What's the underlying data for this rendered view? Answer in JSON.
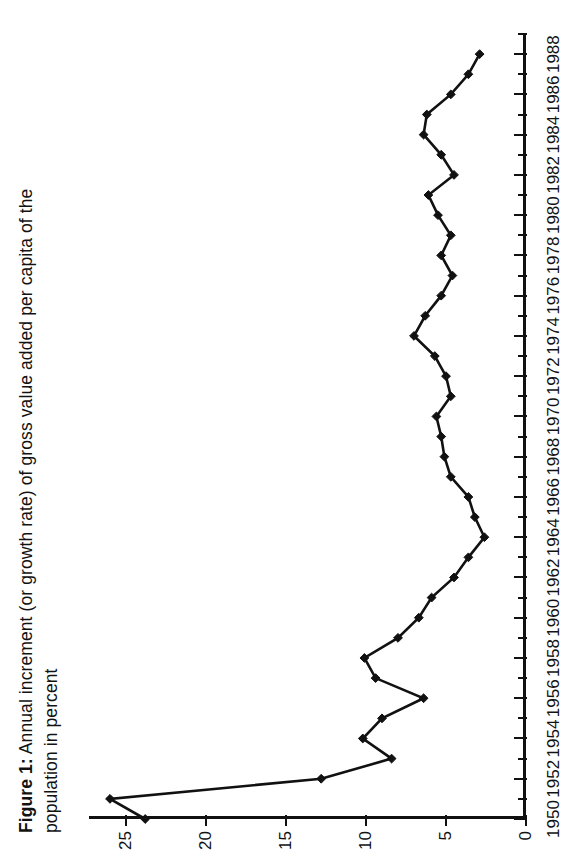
{
  "figure": {
    "label": "Figure 1:",
    "caption": "Annual increment (or growth rate) of gross value added per capita of the population in percent"
  },
  "chart_data": {
    "type": "line",
    "title": "Figure 1: Annual increment (or growth rate) of gross value added per capita of the population in percent",
    "xlabel": "",
    "ylabel": "",
    "xlim": [
      1950,
      1989
    ],
    "ylim": [
      0,
      27.5
    ],
    "grid": false,
    "legend": false,
    "x": [
      1950,
      1951,
      1952,
      1953,
      1954,
      1955,
      1956,
      1957,
      1958,
      1959,
      1960,
      1961,
      1962,
      1963,
      1964,
      1965,
      1966,
      1967,
      1968,
      1969,
      1970,
      1971,
      1972,
      1973,
      1974,
      1975,
      1976,
      1977,
      1978,
      1979,
      1980,
      1981,
      1982,
      1983,
      1984,
      1985,
      1986,
      1987,
      1988
    ],
    "values": [
      23.8,
      26.0,
      12.8,
      8.4,
      10.2,
      9.0,
      6.4,
      9.4,
      10.1,
      8.0,
      6.7,
      5.9,
      4.5,
      3.6,
      2.6,
      3.2,
      3.6,
      4.7,
      5.1,
      5.3,
      5.6,
      4.7,
      5.0,
      5.7,
      7.0,
      6.3,
      5.3,
      4.6,
      5.3,
      4.7,
      5.5,
      6.1,
      4.5,
      5.3,
      6.4,
      6.2,
      4.7,
      3.6,
      2.9
    ],
    "x_tick_labels": [
      "1950",
      "1952",
      "1954",
      "1956",
      "1958",
      "1960",
      "1962",
      "1964",
      "1966",
      "1968",
      "1970",
      "1972",
      "1974",
      "1976",
      "1978",
      "1980",
      "1982",
      "1984",
      "1986",
      "1988"
    ],
    "x_tick_values": [
      1950,
      1952,
      1954,
      1956,
      1958,
      1960,
      1962,
      1964,
      1966,
      1968,
      1970,
      1972,
      1974,
      1976,
      1978,
      1980,
      1982,
      1984,
      1986,
      1988
    ],
    "x_minor_tick_values": [
      1951,
      1953,
      1955,
      1957,
      1959,
      1961,
      1963,
      1965,
      1967,
      1969,
      1971,
      1973,
      1975,
      1977,
      1979,
      1981,
      1983,
      1985,
      1987,
      1989
    ],
    "y_tick_labels": [
      "0",
      "5",
      "10",
      "15",
      "20",
      "25"
    ],
    "y_tick_values": [
      0,
      5,
      10,
      15,
      20,
      25
    ],
    "series_color": "#111111",
    "marker": "diamond"
  }
}
